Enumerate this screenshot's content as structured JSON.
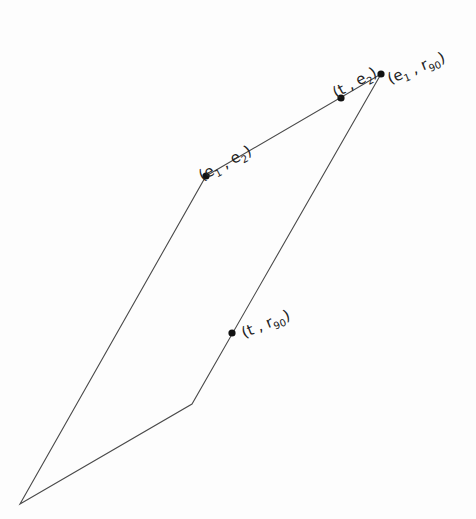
{
  "diagram": {
    "type": "parallelogram-like quadrilateral with labeled points",
    "vertices": [
      {
        "id": "bottom-left",
        "x": 20,
        "y": 504
      },
      {
        "id": "inner-corner",
        "x": 192,
        "y": 404
      },
      {
        "id": "top-right",
        "x": 381,
        "y": 74
      },
      {
        "id": "left-upper",
        "x": 206,
        "y": 176
      }
    ],
    "edges": [
      [
        "bottom-left",
        "inner-corner"
      ],
      [
        "inner-corner",
        "top-right"
      ],
      [
        "top-right",
        "left-upper"
      ],
      [
        "left-upper",
        "bottom-left"
      ]
    ],
    "points": [
      {
        "id": "e1-e2",
        "x": 206,
        "y": 176,
        "label": "(e1 , e2)",
        "label_x": 202,
        "label_y": 162,
        "rotate": -28
      },
      {
        "id": "t-e2",
        "x": 341,
        "y": 98,
        "label": "(t , e2)",
        "label_x": 346,
        "label_y": 80,
        "rotate": -28
      },
      {
        "id": "e1-r90",
        "x": 381,
        "y": 74,
        "label": "(e1 , r90)",
        "label_x": 390,
        "label_y": 80,
        "rotate": -22
      },
      {
        "id": "t-r90",
        "x": 232,
        "y": 333,
        "label": "(t , r90)",
        "label_x": 244,
        "label_y": 335,
        "rotate": -22
      }
    ],
    "colors": {
      "line": "#4a4a4a",
      "dot": "#111111",
      "text": "#222222"
    }
  }
}
